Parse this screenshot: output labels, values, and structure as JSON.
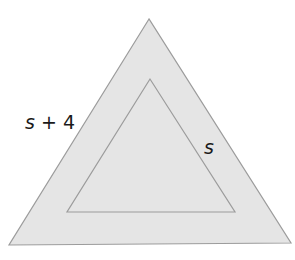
{
  "diagram": {
    "type": "nested-triangles",
    "colors": {
      "fill": "#e5e5e5",
      "stroke": "#9c9c9c",
      "text": "#1a1a1a",
      "background": "#ffffff"
    },
    "outer_triangle": {
      "points": "149,19 9,245 291,243",
      "label": {
        "var": "s",
        "rest": " + 4"
      }
    },
    "inner_triangle": {
      "points": "150,79 67,212 235,212",
      "label": {
        "var": "s"
      }
    }
  }
}
